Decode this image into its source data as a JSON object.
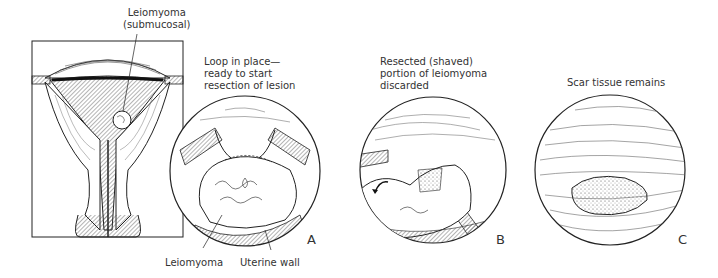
{
  "figure": {
    "uterus_diagram": {
      "callout": "Leiomyoma\n(submucosal)"
    },
    "panels": [
      {
        "letter": "A",
        "caption": "Loop in place—\nready to start\nresection of lesion",
        "callouts": [
          "Leiomyoma",
          "Uterine wall"
        ]
      },
      {
        "letter": "B",
        "caption": "Resected (shaved)\nportion of  leiomyoma\ndiscarded"
      },
      {
        "letter": "C",
        "caption": "Scar tissue remains"
      }
    ]
  }
}
